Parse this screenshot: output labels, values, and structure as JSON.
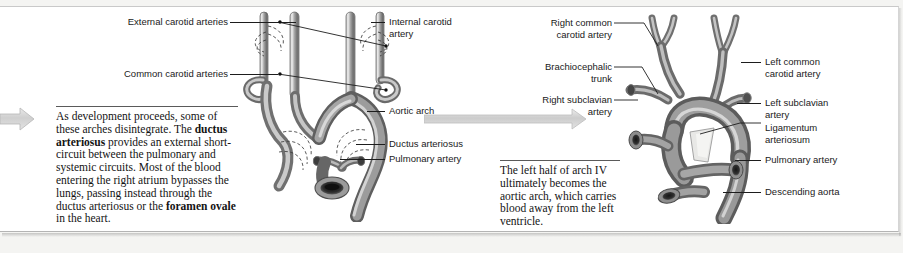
{
  "figure": {
    "background_color": "#f4f4f2",
    "card_color": "#ffffff",
    "text_color": "#1a1a1a",
    "artwork_color": "#8d8d8d",
    "arrow_color": "#c6c6c6"
  },
  "panels": [
    {
      "id": "panel-fetal",
      "labels_left": [
        {
          "name": "external-carotid-arteries",
          "text": "External carotid arteries"
        },
        {
          "name": "common-carotid-arteries",
          "text": "Common carotid arteries"
        }
      ],
      "labels_right": [
        {
          "name": "internal-carotid-artery",
          "text": "Internal carotid\nartery"
        },
        {
          "name": "aortic-arch",
          "text": "Aortic arch"
        },
        {
          "name": "ductus-arteriosus",
          "text": "Ductus arteriosus"
        },
        {
          "name": "pulmonary-artery",
          "text": "Pulmonary artery"
        }
      ],
      "caption_runs": [
        {
          "text": "As development proceeds, some of these arches disintegrate. The ",
          "bold": false
        },
        {
          "text": "ductus arteriosus",
          "bold": true
        },
        {
          "text": " provides an external short-circuit between the pulmonary and systemic circuits. Most of the blood entering the right atrium bypasses the lungs, passing instead through the ductus arteriosus or the ",
          "bold": false
        },
        {
          "text": "foramen ovale",
          "bold": true
        },
        {
          "text": " in the heart.",
          "bold": false
        }
      ],
      "artwork_name": "fetal-aortic-arch-illustration"
    },
    {
      "id": "panel-adult",
      "labels_left": [
        {
          "name": "right-common-carotid-artery",
          "text": "Right common\ncarotid artery"
        },
        {
          "name": "brachiocephalic-trunk",
          "text": "Brachiocephalic\ntrunk"
        },
        {
          "name": "right-subclavian-artery",
          "text": "Right subclavian\nartery"
        }
      ],
      "labels_right": [
        {
          "name": "left-common-carotid-artery",
          "text": "Left common\ncarotid artery"
        },
        {
          "name": "left-subclavian-artery",
          "text": "Left subclavian\nartery"
        },
        {
          "name": "ligamentum-arteriosum",
          "text": "Ligamentum\narteriosum"
        },
        {
          "name": "pulmonary-artery",
          "text": "Pulmonary artery"
        },
        {
          "name": "descending-aorta",
          "text": "Descending aorta"
        }
      ],
      "caption_runs": [
        {
          "text": "The left half of arch IV ultimately becomes the aortic arch, which carries blood away from the left ventricle.",
          "bold": false
        }
      ],
      "artwork_name": "adult-aortic-arch-illustration"
    }
  ],
  "arrows": [
    {
      "name": "stage-arrow-incoming",
      "direction": "right"
    },
    {
      "name": "stage-arrow-between-panels",
      "direction": "right"
    }
  ]
}
